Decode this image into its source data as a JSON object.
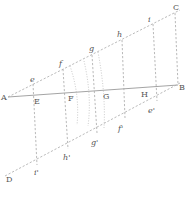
{
  "diagram": {
    "type": "geometric-construction",
    "points": {
      "A": "A",
      "B": "B",
      "C": "C",
      "D": "D",
      "E": "E",
      "F": "F",
      "G": "G",
      "H": "H"
    },
    "upper_line_labels": [
      "e",
      "f",
      "g",
      "h",
      "i"
    ],
    "lower_line_labels": [
      "i'",
      "h'",
      "g'",
      "f'",
      "e'"
    ],
    "lines": [
      {
        "from": "A",
        "to": "B",
        "style": "solid"
      },
      {
        "from": "A",
        "to": "C",
        "style": "dashed"
      },
      {
        "from": "D",
        "to": "B",
        "style": "dashed"
      }
    ],
    "colors": {
      "ink": "#555555",
      "line": "#9a9a9a"
    }
  }
}
